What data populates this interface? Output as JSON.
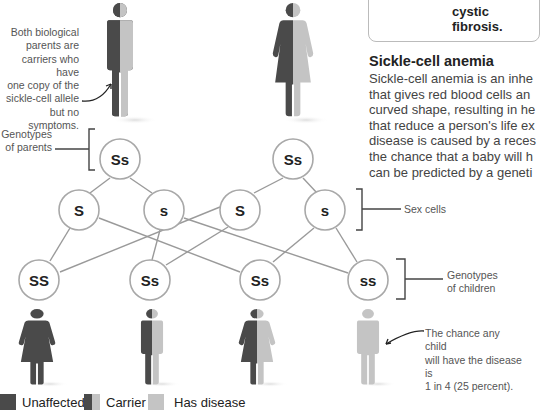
{
  "infobox": {
    "text": "cystic fibrosis."
  },
  "section": {
    "title": "Sickle-cell anemia",
    "body_lines": [
      "Sickle-cell anemia is an inhe",
      "that gives red blood cells an",
      "curved shape, resulting in he",
      "that reduce a person's life ex",
      "disease is caused by a reces",
      "the chance that a baby will h",
      "can be predicted by a geneti"
    ]
  },
  "annotations": {
    "parents_note": [
      "Both biological",
      "parents are",
      "carriers who have",
      "one copy of the",
      "sickle-cell allele",
      "but no symptoms."
    ],
    "genotypes_parents": [
      "Genotypes",
      "of parents"
    ],
    "sex_cells": "Sex cells",
    "genotypes_children": [
      "Genotypes",
      "of children"
    ],
    "chance_note": [
      "The chance any child",
      "will have the disease is",
      "1 in 4 (25 percent)."
    ]
  },
  "diagram": {
    "parents": [
      {
        "genotype": "Ss",
        "figure": "male",
        "status": "carrier"
      },
      {
        "genotype": "Ss",
        "figure": "female",
        "status": "carrier"
      }
    ],
    "sex_cells": [
      "S",
      "s",
      "S",
      "s"
    ],
    "children": [
      {
        "genotype": "SS",
        "figure": "female",
        "status": "unaffected"
      },
      {
        "genotype": "Ss",
        "figure": "male",
        "status": "carrier"
      },
      {
        "genotype": "Ss",
        "figure": "female",
        "status": "carrier"
      },
      {
        "genotype": "ss",
        "figure": "male",
        "status": "has disease"
      }
    ]
  },
  "legend": {
    "items": [
      {
        "label": "Unaffected",
        "color": "#4a4a4a"
      },
      {
        "label": "Carrier",
        "color": "split"
      },
      {
        "label": "Has disease",
        "color": "#c4c4c4"
      }
    ]
  },
  "colors": {
    "dark": "#4a4a4a",
    "light": "#c4c4c4",
    "line": "#999999"
  }
}
